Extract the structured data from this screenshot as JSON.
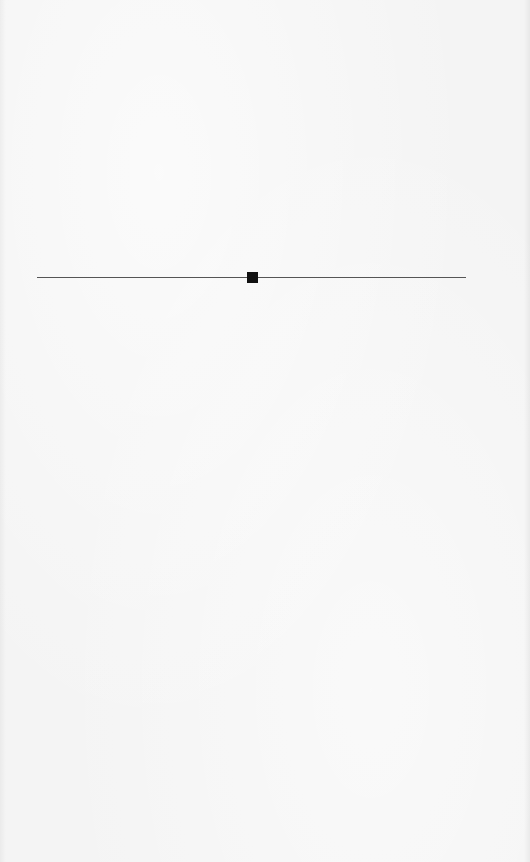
{
  "page": {
    "background_color": "#f4f4f4"
  },
  "section_break": {
    "rule_color": "#555555",
    "ornament": "square-ornament",
    "ornament_color": "#111111"
  }
}
